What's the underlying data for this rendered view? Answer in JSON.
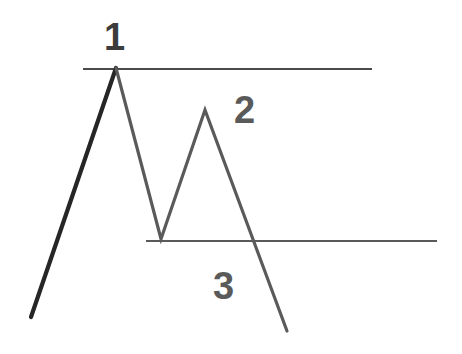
{
  "figure": {
    "background_color": "#ffffff",
    "width": 462,
    "height": 354
  },
  "labels": [
    {
      "id": "1",
      "text": "1",
      "x": 104,
      "y": 18,
      "color": "#3c3c3c",
      "meaning": "first-peak-label"
    },
    {
      "id": "2",
      "text": "2",
      "x": 234,
      "y": 91,
      "color": "#5a5a5a",
      "meaning": "second-peak-label"
    },
    {
      "id": "3",
      "text": "3",
      "x": 213,
      "y": 267,
      "color": "#5a5a5a",
      "meaning": "breakdown-label"
    }
  ],
  "levels": [
    {
      "name": "resistance-line",
      "y": 69,
      "x_start": 83,
      "x_end": 372,
      "color": "#4a4a4a",
      "width": 2
    },
    {
      "name": "support-line",
      "y": 241,
      "x_start": 146,
      "x_end": 437,
      "color": "#5a5a5a",
      "width": 2
    }
  ],
  "chart_data": {
    "type": "line",
    "xlabel": "",
    "ylabel": "",
    "xlim": [
      0,
      462
    ],
    "ylim": [
      354,
      0
    ],
    "grid": false,
    "legend": "none",
    "series": [
      {
        "name": "rally-to-peak-1",
        "color": "#262626",
        "width": 4,
        "points": [
          {
            "x": 31,
            "y": 317
          },
          {
            "x": 116,
            "y": 68
          }
        ]
      },
      {
        "name": "pattern-path",
        "color": "#5a5a5a",
        "width": 3,
        "points": [
          {
            "x": 116,
            "y": 68
          },
          {
            "x": 161,
            "y": 239
          },
          {
            "x": 205,
            "y": 110
          },
          {
            "x": 287,
            "y": 331
          }
        ]
      }
    ],
    "annotations": [
      {
        "text": "1",
        "x": 116,
        "y": 40,
        "note": "peak 1 at resistance"
      },
      {
        "text": "2",
        "x": 247,
        "y": 110,
        "note": "lower high"
      },
      {
        "text": "3",
        "x": 224,
        "y": 285,
        "note": "break of support"
      }
    ]
  }
}
